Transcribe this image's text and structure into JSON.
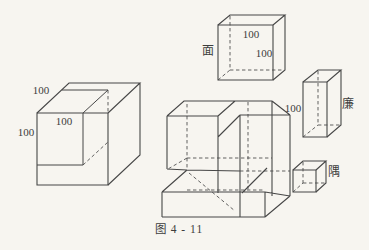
{
  "page": {
    "background": "#f7f5f0"
  },
  "figure": {
    "caption": "图 4 - 11",
    "line_color": "#474747",
    "text_color": "#3d3d3d",
    "big_cube": {
      "label_top": "100",
      "label_face": "100",
      "label_side": "100"
    },
    "mian": {
      "name": "面",
      "label_width": "100",
      "label_height": "100"
    },
    "lian": {
      "name": "廉",
      "label": "100"
    },
    "yu": {
      "name": "隅"
    }
  }
}
